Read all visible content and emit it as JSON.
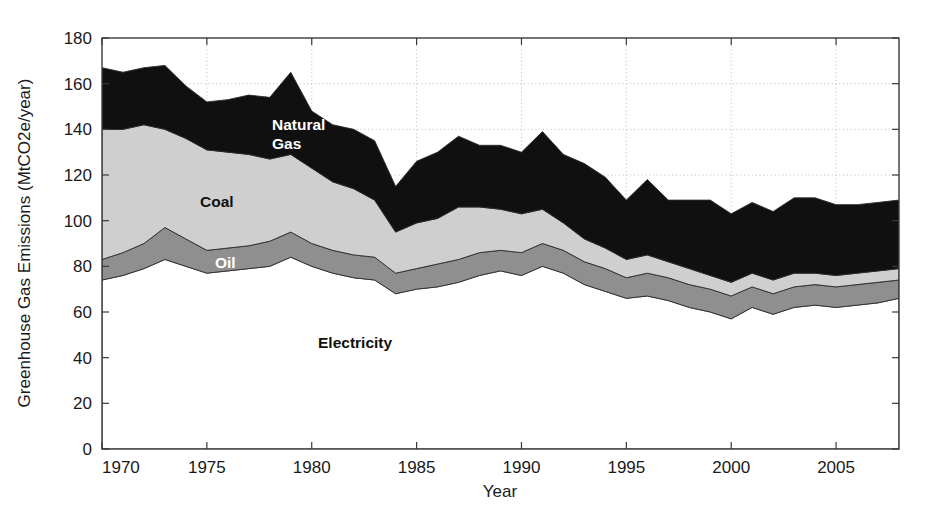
{
  "chart_data": {
    "type": "area",
    "stacked": true,
    "title": "",
    "xlabel": "Year",
    "ylabel": "Greenhouse Gas Emissions (MtCO2e/year)",
    "xlim": [
      1970,
      2008
    ],
    "ylim": [
      0,
      180
    ],
    "xticks": [
      1970,
      1975,
      1980,
      1985,
      1990,
      1995,
      2000,
      2005
    ],
    "yticks": [
      0,
      20,
      40,
      60,
      80,
      100,
      120,
      140,
      160,
      180
    ],
    "grid": true,
    "legend_position": "inline-annotations",
    "x": [
      1970,
      1971,
      1972,
      1973,
      1974,
      1975,
      1976,
      1977,
      1978,
      1979,
      1980,
      1981,
      1982,
      1983,
      1984,
      1985,
      1986,
      1987,
      1988,
      1989,
      1990,
      1991,
      1992,
      1993,
      1994,
      1995,
      1996,
      1997,
      1998,
      1999,
      2000,
      2001,
      2002,
      2003,
      2004,
      2005,
      2006,
      2007,
      2008
    ],
    "series": [
      {
        "name": "Electricity",
        "fill": "#ffffff",
        "label_color": "#111111",
        "values": [
          74,
          76,
          79,
          83,
          80,
          77,
          78,
          79,
          80,
          84,
          80,
          77,
          75,
          74,
          68,
          70,
          71,
          73,
          76,
          78,
          76,
          80,
          77,
          72,
          69,
          66,
          67,
          65,
          62,
          60,
          57,
          62,
          59,
          62,
          63,
          62,
          63,
          64,
          66
        ]
      },
      {
        "name": "Oil",
        "fill": "#8f8f8f",
        "label_color": "#ffffff",
        "values": [
          9,
          10,
          11,
          14,
          12,
          10,
          10,
          10,
          11,
          11,
          10,
          10,
          10,
          10,
          9,
          9,
          10,
          10,
          10,
          9,
          10,
          10,
          10,
          10,
          10,
          9,
          10,
          10,
          10,
          10,
          10,
          9,
          9,
          9,
          9,
          9,
          9,
          9,
          8
        ]
      },
      {
        "name": "Coal",
        "fill": "#cfcfcf",
        "label_color": "#111111",
        "values": [
          57,
          54,
          52,
          43,
          44,
          44,
          42,
          40,
          36,
          34,
          33,
          30,
          29,
          25,
          18,
          20,
          20,
          23,
          20,
          18,
          17,
          15,
          12,
          10,
          9,
          8,
          8,
          7,
          7,
          6,
          6,
          6,
          6,
          6,
          5,
          5,
          5,
          5,
          5
        ]
      },
      {
        "name": "Natural Gas",
        "fill": "#101010",
        "label_color": "#ffffff",
        "values": [
          27,
          25,
          25,
          28,
          23,
          21,
          23,
          26,
          27,
          36,
          25,
          25,
          26,
          26,
          20,
          27,
          29,
          31,
          27,
          28,
          27,
          34,
          30,
          33,
          31,
          26,
          33,
          27,
          30,
          33,
          30,
          31,
          30,
          33,
          33,
          31,
          30,
          30,
          30
        ]
      }
    ],
    "annotations": [
      {
        "text": "Natural Gas",
        "lines": [
          "Natural",
          "Gas"
        ],
        "x_px": 272,
        "y_px": 130,
        "color": "#ffffff"
      },
      {
        "text": "Coal",
        "lines": [
          "Coal"
        ],
        "x_px": 200,
        "y_px": 207,
        "color": "#111111"
      },
      {
        "text": "Oil",
        "lines": [
          "Oil"
        ],
        "x_px": 215,
        "y_px": 268,
        "color": "#ffffff"
      },
      {
        "text": "Electricity",
        "lines": [
          "Electricity"
        ],
        "x_px": 318,
        "y_px": 348,
        "color": "#111111"
      }
    ]
  }
}
